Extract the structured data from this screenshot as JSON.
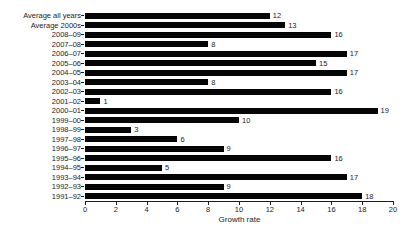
{
  "chart_data": {
    "type": "bar",
    "orientation": "horizontal",
    "title": "",
    "xlabel": "Growth rate",
    "ylabel": "",
    "categories": [
      "Average all years",
      "Average 2000s",
      "2008–09",
      "2007–08",
      "2006–07",
      "2005–06",
      "2004–05",
      "2003–04",
      "2002–03",
      "2001–02",
      "2000–01",
      "1999–00",
      "1998–99",
      "1997–98",
      "1996–97",
      "1995–96",
      "1994–95",
      "1993–94",
      "1992–93",
      "1991–92"
    ],
    "values": [
      12,
      13,
      16,
      8,
      17,
      15,
      17,
      8,
      16,
      1,
      19,
      10,
      3,
      6,
      9,
      16,
      5,
      17,
      9,
      18
    ],
    "xlim": [
      0,
      20
    ],
    "xticks": [
      0,
      2,
      4,
      6,
      8,
      10,
      12,
      14,
      16,
      18,
      20
    ],
    "bar_color": "#050505",
    "text_color": "#1c1c1c",
    "grid": false,
    "legend": false,
    "value_labels": true
  }
}
